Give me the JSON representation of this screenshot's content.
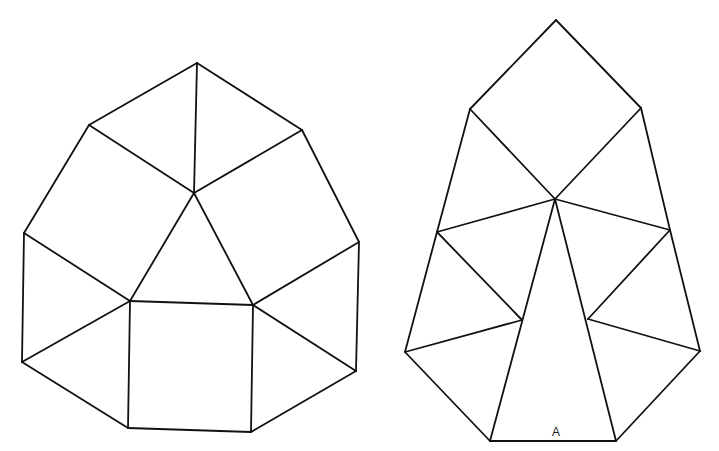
{
  "canvas": {
    "width": 719,
    "height": 451,
    "background": "#ffffff",
    "stroke": "#111111"
  },
  "figures": [
    {
      "name": "left-net",
      "vertices": {
        "top": [
          197,
          63
        ],
        "ul": [
          89,
          125
        ],
        "ur": [
          302,
          130
        ],
        "c": [
          194,
          193
        ],
        "lm": [
          24,
          233
        ],
        "rm": [
          359,
          242
        ],
        "sq_tl": [
          130,
          301
        ],
        "sq_tr": [
          253,
          305
        ],
        "ll": [
          22,
          362
        ],
        "rl": [
          356,
          371
        ],
        "sq_bl": [
          128,
          428
        ],
        "sq_br": [
          251,
          432
        ]
      },
      "edges": [
        [
          "top",
          "ul"
        ],
        [
          "top",
          "ur"
        ],
        [
          "top",
          "c"
        ],
        [
          "ul",
          "c"
        ],
        [
          "ur",
          "c"
        ],
        [
          "ul",
          "lm"
        ],
        [
          "ur",
          "rm"
        ],
        [
          "c",
          "sq_tl"
        ],
        [
          "c",
          "sq_tr"
        ],
        [
          "lm",
          "sq_tl"
        ],
        [
          "rm",
          "sq_tr"
        ],
        [
          "lm",
          "ll"
        ],
        [
          "rm",
          "rl"
        ],
        [
          "ll",
          "sq_tl"
        ],
        [
          "rl",
          "sq_tr"
        ],
        [
          "sq_tl",
          "sq_tr"
        ],
        [
          "sq_tr",
          "sq_br"
        ],
        [
          "sq_br",
          "sq_bl"
        ],
        [
          "sq_bl",
          "sq_tl"
        ],
        [
          "ll",
          "sq_bl"
        ],
        [
          "rl",
          "sq_br"
        ]
      ]
    },
    {
      "name": "right-net",
      "label": {
        "text": "A",
        "x": 556,
        "y": 436
      },
      "vertices": {
        "top": [
          556,
          20
        ],
        "sl": [
          470,
          109
        ],
        "sr": [
          641,
          108
        ],
        "c": [
          555,
          199
        ],
        "lm": [
          437,
          232
        ],
        "rm": [
          670,
          230
        ],
        "il": [
          522,
          320
        ],
        "ir": [
          588,
          319
        ],
        "ll": [
          405,
          352
        ],
        "rl": [
          700,
          351
        ],
        "bl": [
          490,
          441
        ],
        "br": [
          616,
          441
        ]
      },
      "edges": [
        [
          "top",
          "sl"
        ],
        [
          "top",
          "sr"
        ],
        [
          "sl",
          "c"
        ],
        [
          "sr",
          "c"
        ],
        [
          "sl",
          "lm"
        ],
        [
          "sr",
          "rm"
        ],
        [
          "c",
          "lm"
        ],
        [
          "c",
          "rm"
        ],
        [
          "c",
          "bl"
        ],
        [
          "c",
          "br"
        ],
        [
          "lm",
          "il"
        ],
        [
          "rm",
          "ir"
        ],
        [
          "lm",
          "ll"
        ],
        [
          "rm",
          "rl"
        ],
        [
          "ll",
          "il"
        ],
        [
          "rl",
          "ir"
        ],
        [
          "ll",
          "bl"
        ],
        [
          "rl",
          "br"
        ],
        [
          "bl",
          "br"
        ]
      ]
    }
  ]
}
